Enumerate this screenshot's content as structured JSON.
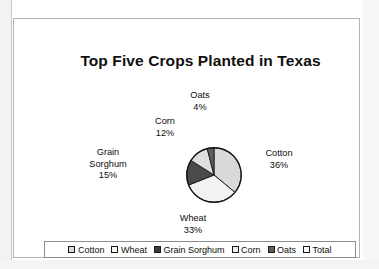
{
  "chart_data": {
    "type": "pie",
    "title": "Top Five Crops Planted in Texas",
    "categories": [
      "Cotton",
      "Wheat",
      "Grain Sorghum",
      "Corn",
      "Oats"
    ],
    "values": [
      36,
      33,
      15,
      12,
      4
    ],
    "value_unit": "%",
    "labels": [
      {
        "name": "Cotton",
        "pct": "36%",
        "value": 36,
        "color": "#d9d9d9"
      },
      {
        "name": "Wheat",
        "pct": "33%",
        "value": 33,
        "color": "#f2f2f2"
      },
      {
        "name": "Grain Sorghum",
        "pct": "15%",
        "value": 15,
        "color": "#4a4a4a"
      },
      {
        "name": "Corn",
        "pct": "12%",
        "value": 12,
        "color": "#dedede"
      },
      {
        "name": "Oats",
        "pct": "4%",
        "value": 4,
        "color": "#5e5e5e"
      }
    ],
    "grain_sorghum_line1": "Grain",
    "grain_sorghum_line2": "Sorghum",
    "legend_position": "bottom",
    "grid": false,
    "start_angle_deg": 0,
    "direction": "clockwise"
  },
  "legend": {
    "items": [
      {
        "label": "Cotton",
        "swatch": "#d9d9d9"
      },
      {
        "label": "Wheat",
        "swatch": "#f7f7f7"
      },
      {
        "label": "Grain Sorghum",
        "swatch": "#3d3d3d"
      },
      {
        "label": "Corn",
        "swatch": "#ececec"
      },
      {
        "label": "Oats",
        "swatch": "#5e5e5e"
      },
      {
        "label": "Total",
        "swatch": "#fbfbfb"
      }
    ]
  },
  "colors": {
    "frame_border": "#b4b4b4",
    "legend_border": "#8c8c8c",
    "pie_outline": "#1a1a1a",
    "text": "#0c0c0c"
  }
}
